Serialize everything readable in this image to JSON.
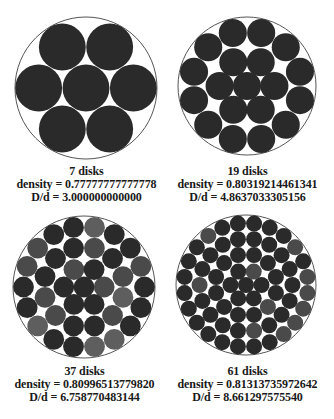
{
  "figure": {
    "panels": [
      {
        "id": "p7",
        "count": 7,
        "label": "7 disks",
        "density": "density =  0.77777777777778",
        "ratio": "D/d = 3.000000000000",
        "cx": 86,
        "cy": 88,
        "R": 71,
        "ratio_value": 3.0,
        "shading": "dark"
      },
      {
        "id": "p19",
        "count": 19,
        "label": "19 disks",
        "density": "density = 0.80319214461341",
        "ratio": "D/d = 4.8637033305156",
        "cx": 247,
        "cy": 86,
        "R": 69,
        "ratio_value": 4.8637033305156,
        "shading": "dark"
      },
      {
        "id": "p37",
        "count": 37,
        "label": "37 disks",
        "density": "density = 0.80996513779820",
        "ratio": "D/d = 6.758770483144",
        "cx": 84,
        "cy": 287,
        "R": 71,
        "ratio_value": 6.758770483144,
        "shading": "mixed"
      },
      {
        "id": "p61",
        "count": 61,
        "label": "61 disks",
        "density": "density = 0.81313735972642",
        "ratio": "D/d = 8.661297575540",
        "cx": 246,
        "cy": 285,
        "R": 70,
        "ratio_value": 8.66129757554,
        "shading": "dark"
      }
    ],
    "colors": {
      "disk_dark": "#2a2a2a",
      "disk_mid": "#4a4a4a",
      "disk_light": "#5e5e5e",
      "outline": "#555555",
      "background": "#ffffff"
    }
  }
}
